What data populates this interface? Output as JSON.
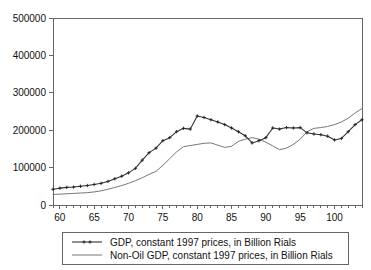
{
  "chart_data": {
    "type": "line",
    "title": "",
    "xlabel": "",
    "ylabel": "",
    "xlim": [
      59,
      104
    ],
    "ylim": [
      0,
      500000
    ],
    "grid": false,
    "legend_position": "below",
    "y_ticks": [
      0,
      100000,
      200000,
      300000,
      400000,
      500000
    ],
    "y_tick_labels": [
      "0",
      "100000",
      "200000",
      "300000",
      "400000",
      "500000"
    ],
    "x_ticks": [
      60,
      65,
      70,
      75,
      80,
      85,
      90,
      95,
      100
    ],
    "x_tick_labels": [
      "60",
      "65",
      "70",
      "75",
      "80",
      "85",
      "90",
      "95",
      "100"
    ],
    "x_minor_step": 1,
    "x": [
      59,
      60,
      61,
      62,
      63,
      64,
      65,
      66,
      67,
      68,
      69,
      70,
      71,
      72,
      73,
      74,
      75,
      76,
      77,
      78,
      79,
      80,
      81,
      82,
      83,
      84,
      85,
      86,
      87,
      88,
      89,
      90,
      91,
      92,
      93,
      94,
      95,
      96,
      97,
      98,
      99,
      100,
      101,
      102,
      103,
      104
    ],
    "series": [
      {
        "name": "GDP, constant 1997 prices, in Billion Rials",
        "marker": "cross",
        "color": "#333333",
        "values": [
          42000,
          45000,
          47000,
          48000,
          50000,
          52000,
          55000,
          58000,
          63000,
          70000,
          77000,
          86000,
          98000,
          120000,
          140000,
          152000,
          172000,
          180000,
          196000,
          205000,
          203000,
          238000,
          234000,
          228000,
          222000,
          215000,
          206000,
          196000,
          185000,
          166000,
          172000,
          180000,
          206000,
          203000,
          207000,
          206000,
          207000,
          193000,
          190000,
          188000,
          184000,
          174000,
          178000,
          196000,
          215000,
          228000
        ]
      },
      {
        "name": "Non-Oil GDP, constant 1997 prices, in Billion Rials",
        "marker": "none",
        "color": "#777777",
        "values": [
          28000,
          29000,
          30000,
          31000,
          32000,
          33000,
          35000,
          38000,
          42000,
          47000,
          52000,
          58000,
          65000,
          73000,
          82000,
          90000,
          106000,
          124000,
          142000,
          156000,
          159000,
          162000,
          165000,
          166000,
          160000,
          154000,
          157000,
          170000,
          176000,
          180000,
          176000,
          168000,
          158000,
          148000,
          152000,
          162000,
          176000,
          196000,
          205000,
          207000,
          210000,
          215000,
          222000,
          232000,
          246000,
          258000
        ]
      }
    ],
    "legend": [
      {
        "label": "GDP, constant 1997 prices, in Billion Rials",
        "marker": "line-with-cross"
      },
      {
        "label": "Non-Oil GDP, constant 1997 prices, in Billion Rials",
        "marker": "line"
      }
    ],
    "colors": {
      "gdp": "#333333",
      "nonoil": "#777777",
      "axis": "#666666",
      "text": "#111111",
      "background": "#ffffff"
    }
  }
}
